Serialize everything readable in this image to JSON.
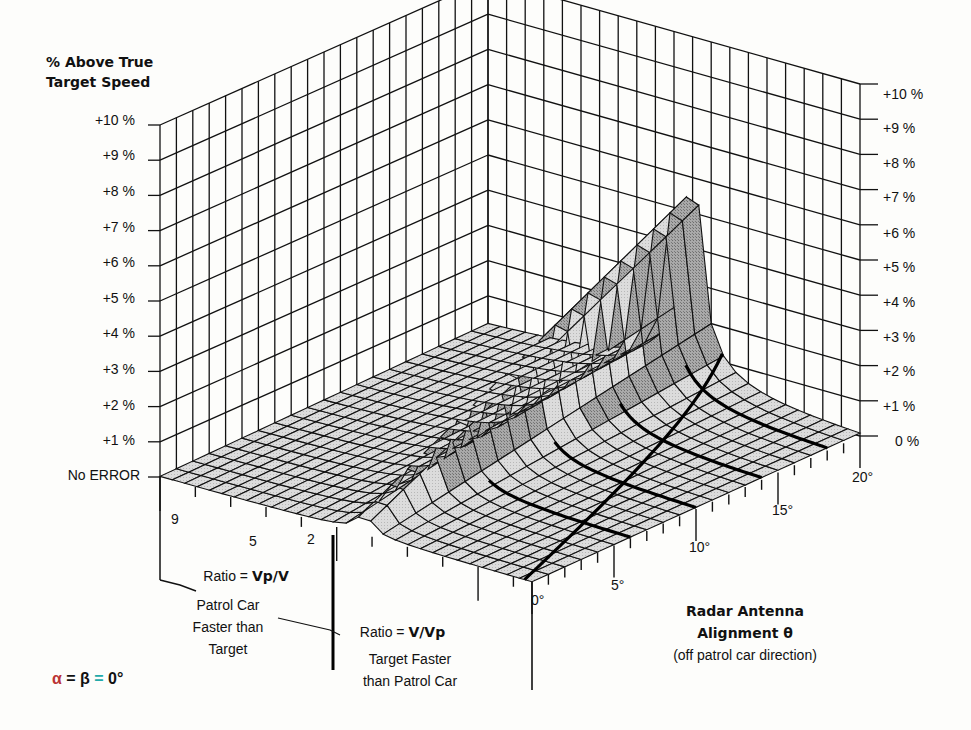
{
  "chart_data": {
    "type": "surface3d",
    "title": "",
    "zlabel": "% Above True Target Speed",
    "z_ticks_left": [
      "No ERROR",
      "+1 %",
      "+2 %",
      "+3 %",
      "+4 %",
      "+5 %",
      "+6 %",
      "+7 %",
      "+8 %",
      "+9 %",
      "+10 %"
    ],
    "z_ticks_right": [
      "0 %",
      "+1 %",
      "+2 %",
      "+3 %",
      "+4 %",
      "+5 %",
      "+6 %",
      "+7 %",
      "+8 %",
      "+9 %",
      "+10 %"
    ],
    "zlim": [
      0,
      10
    ],
    "x_axis": {
      "label": "Radar Antenna Alignment θ",
      "sublabel": "(off patrol car direction)",
      "ticks": [
        "0°",
        "5°",
        "10°",
        "15°",
        "20°"
      ],
      "range": [
        0,
        20
      ]
    },
    "y_axis": {
      "left_label": "Ratio = Vp/V",
      "left_desc": "Patrol Car Faster than Target",
      "left_ticks": [
        "9",
        "5",
        "2"
      ],
      "right_label": "Ratio = V/Vp",
      "right_desc": "Target Faster than Patrol Car"
    },
    "annotation": "α = β = 0°",
    "highlighted_curves": 5
  },
  "labels": {
    "ztitle_line1": "% Above True",
    "ztitle_line2": "Target Speed",
    "left_ticks": [
      "No ERROR",
      "+1 %",
      "+2 %",
      "+3 %",
      "+4 %",
      "+5 %",
      "+6 %",
      "+7 %",
      "+8 %",
      "+9 %",
      "+10 %"
    ],
    "right_ticks": [
      "0 %",
      "+1 %",
      "+2 %",
      "+3 %",
      "+4 %",
      "+5 %",
      "+6 %",
      "+7 %",
      "+8 %",
      "+9 %",
      "+10 %"
    ],
    "ratio_ticks": [
      "9",
      "5",
      "2"
    ],
    "angle_ticks": [
      "0°",
      "5°",
      "10°",
      "15°",
      "20°"
    ],
    "ratio_left_prefix": "Ratio = ",
    "ratio_left_bold": "Vp/V",
    "left_desc_1": "Patrol Car",
    "left_desc_2": "Faster than",
    "left_desc_3": "Target",
    "ratio_right_prefix": "Ratio = ",
    "ratio_right_bold": "V/Vp",
    "right_desc_1": "Target Faster",
    "right_desc_2": "than Patrol Car",
    "axis_title_1": "Radar Antenna",
    "axis_title_2": "Alignment θ",
    "axis_title_3": "(off patrol car direction)",
    "formula_alpha": "α",
    "formula_eq1": " = ",
    "formula_beta": "β",
    "formula_eq2": " = ",
    "formula_zero": "0°"
  }
}
